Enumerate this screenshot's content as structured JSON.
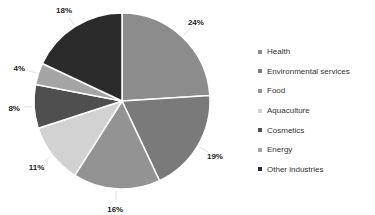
{
  "chart_data": {
    "type": "pie",
    "title": "",
    "categories": [
      "Health",
      "Environmental services",
      "Food",
      "Aquaculture",
      "Cosmetics",
      "Energy",
      "Other industries"
    ],
    "values": [
      24,
      19,
      16,
      11,
      8,
      4,
      18
    ],
    "labels": [
      "24%",
      "19%",
      "16%",
      "11%",
      "8%",
      "4%",
      "18%"
    ],
    "colors": [
      "#8c8c8c",
      "#7a7a7a",
      "#939393",
      "#d2d2d2",
      "#4f4f4f",
      "#a4a4a4",
      "#2b2b2b"
    ],
    "start_angle_deg": 0,
    "direction": "clockwise",
    "legend_position": "right"
  },
  "legend": {
    "items": [
      {
        "label": "Health",
        "color": "#8c8c8c"
      },
      {
        "label": "Environmental services",
        "color": "#7a7a7a"
      },
      {
        "label": "Food",
        "color": "#939393"
      },
      {
        "label": "Aquaculture",
        "color": "#d2d2d2"
      },
      {
        "label": "Cosmetics",
        "color": "#4f4f4f"
      },
      {
        "label": "Energy",
        "color": "#a4a4a4"
      },
      {
        "label": "Other industries",
        "color": "#2b2b2b"
      }
    ]
  }
}
